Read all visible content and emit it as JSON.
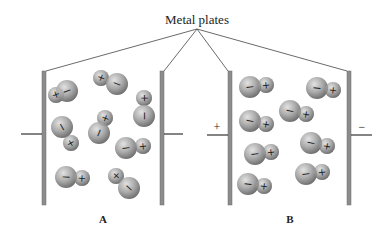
{
  "diagram": {
    "title_label": "Metal plates",
    "panels": [
      {
        "id": "A",
        "label": "A",
        "left_terminal_sign": "",
        "right_terminal_sign": "",
        "description": "randomly oriented polar molecules (no field)",
        "molecules": [
          {
            "nx": 67,
            "ny": 91,
            "px": 56,
            "py": 95,
            "r_neg": 11,
            "r_pos": 8
          },
          {
            "nx": 117,
            "ny": 84,
            "px": 101,
            "py": 78,
            "r_neg": 11,
            "r_pos": 8
          },
          {
            "nx": 144,
            "ny": 116,
            "px": 144,
            "py": 98,
            "r_neg": 11,
            "r_pos": 8
          },
          {
            "nx": 62,
            "ny": 127,
            "px": 71,
            "py": 143,
            "r_neg": 11,
            "r_pos": 8
          },
          {
            "nx": 99,
            "ny": 133,
            "px": 105,
            "py": 118,
            "r_neg": 11,
            "r_pos": 8
          },
          {
            "nx": 126,
            "ny": 148,
            "px": 143,
            "py": 146,
            "r_neg": 11,
            "r_pos": 8
          },
          {
            "nx": 66,
            "ny": 177,
            "px": 82,
            "py": 178,
            "r_neg": 11,
            "r_pos": 8
          },
          {
            "nx": 129,
            "ny": 188,
            "px": 116,
            "py": 176,
            "r_neg": 11,
            "r_pos": 8
          }
        ]
      },
      {
        "id": "B",
        "label": "B",
        "left_terminal_sign": "+",
        "right_terminal_sign": "−",
        "description": "polar molecules aligned with field (negative end toward + plate)",
        "molecules": [
          {
            "nx": 250,
            "ny": 87,
            "px": 266,
            "py": 85,
            "r_neg": 11,
            "r_pos": 8
          },
          {
            "nx": 317,
            "ny": 88,
            "px": 333,
            "py": 90,
            "r_neg": 11,
            "r_pos": 8
          },
          {
            "nx": 290,
            "ny": 111,
            "px": 306,
            "py": 114,
            "r_neg": 11,
            "r_pos": 8
          },
          {
            "nx": 250,
            "ny": 121,
            "px": 266,
            "py": 124,
            "r_neg": 11,
            "r_pos": 8
          },
          {
            "nx": 311,
            "ny": 143,
            "px": 327,
            "py": 146,
            "r_neg": 11,
            "r_pos": 8
          },
          {
            "nx": 255,
            "ny": 154,
            "px": 271,
            "py": 152,
            "r_neg": 11,
            "r_pos": 8
          },
          {
            "nx": 306,
            "ny": 174,
            "px": 322,
            "py": 172,
            "r_neg": 11,
            "r_pos": 8
          },
          {
            "nx": 248,
            "ny": 184,
            "px": 264,
            "py": 186,
            "r_neg": 11,
            "r_pos": 8
          }
        ]
      }
    ],
    "colors": {
      "plate": "#8c8c8c",
      "plate_edge": "#6e6e6e",
      "line": "#333333",
      "atom_light": "#dcdcdc",
      "atom_mid": "#a8a8a8",
      "atom_dark": "#6f6f6f",
      "sign": "#1a1a1a"
    },
    "signs": {
      "negative": "−",
      "positive": "+"
    }
  }
}
